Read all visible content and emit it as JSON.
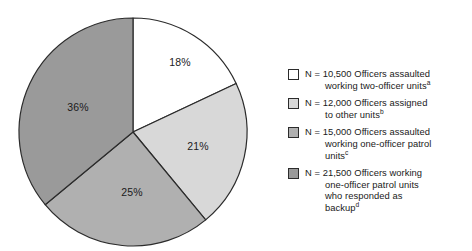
{
  "chart_data": {
    "type": "pie",
    "title": "",
    "categories": [
      "N = 10,500 Officers assaulted working two-officer units",
      "N = 12,000 Officers assigned to other units",
      "N = 15,000 Officers assaulted working one-officer patrol units",
      "N = 21,500 Officers working one-officer patrol units who responded as backup"
    ],
    "values": [
      18,
      21,
      25,
      36
    ],
    "value_labels": [
      "18%",
      "21%",
      "25%",
      "36%"
    ],
    "counts": [
      10500,
      12000,
      15000,
      21500
    ],
    "footnote_markers": [
      "a",
      "b",
      "c",
      "d"
    ],
    "colors": [
      "#ffffff",
      "#d8d8d8",
      "#b0b0b0",
      "#9a9a9a"
    ],
    "start_angle_deg": 0,
    "direction": "clockwise",
    "legend_position": "right",
    "grid": false,
    "xlabel": "",
    "ylabel": ""
  },
  "pie": {
    "slices": [
      {
        "label": "18%",
        "value": 18,
        "color": "#ffffff",
        "label_x": 180,
        "label_y": 62
      },
      {
        "label": "21%",
        "value": 21,
        "color": "#d8d8d8",
        "label_x": 198,
        "label_y": 146
      },
      {
        "label": "25%",
        "value": 25,
        "color": "#b0b0b0",
        "label_x": 132,
        "label_y": 192
      },
      {
        "label": "36%",
        "value": 36,
        "color": "#9a9a9a",
        "label_x": 78,
        "label_y": 107
      }
    ]
  },
  "legend": {
    "items": [
      {
        "swatch_color": "#ffffff",
        "line1": "N = 10,500 Officers assaulted",
        "line2": "working two-officer units",
        "marker": "a"
      },
      {
        "swatch_color": "#d8d8d8",
        "line1": "N = 12,000 Officers assigned",
        "line2": "to other units",
        "marker": "b"
      },
      {
        "swatch_color": "#b0b0b0",
        "line1": "N = 15,000 Officers assaulted",
        "line2": "working one-officer patrol",
        "line3": "units",
        "marker": "c"
      },
      {
        "swatch_color": "#9a9a9a",
        "line1": "N = 21,500 Officers working",
        "line2": "one-officer patrol units",
        "line3": "who responded as",
        "line4": "backup",
        "marker": "d"
      }
    ]
  }
}
